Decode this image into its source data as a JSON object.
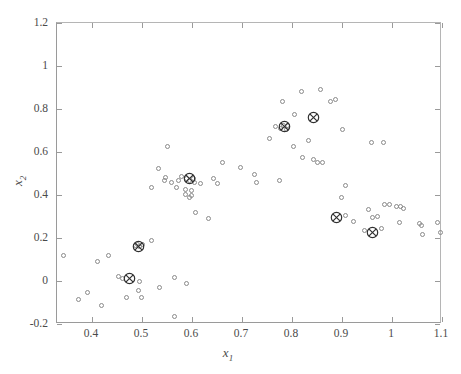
{
  "chart_data": {
    "type": "scatter",
    "title": "",
    "xlabel": "x₁",
    "ylabel": "x₂",
    "xlim": [
      0.33,
      1.1
    ],
    "ylim": [
      -0.2,
      1.2
    ],
    "xticks": [
      0.4,
      0.5,
      0.6,
      0.7,
      0.8,
      0.9,
      1.0,
      1.1
    ],
    "yticks": [
      -0.2,
      0,
      0.2,
      0.4,
      0.6,
      0.8,
      1.0,
      1.2
    ],
    "xticklabels": [
      "0.4",
      "0.5",
      "0.6",
      "0.7",
      "0.8",
      "0.9",
      "1",
      "1.1"
    ],
    "yticklabels": [
      "-0.2",
      "0",
      "0.2",
      "0.4",
      "0.6",
      "0.8",
      "1",
      "1.2"
    ],
    "grid": false,
    "legend": null,
    "marker_color": "#8a8a8a",
    "center_color": "#303030",
    "series": [
      {
        "name": "data-points",
        "marker": "open-circle",
        "points": [
          [
            0.345,
            0.112
          ],
          [
            0.374,
            -0.09
          ],
          [
            0.392,
            -0.057
          ],
          [
            0.42,
            -0.118
          ],
          [
            0.412,
            0.084
          ],
          [
            0.434,
            0.112
          ],
          [
            0.455,
            0.014
          ],
          [
            0.462,
            0.005
          ],
          [
            0.47,
            -0.08
          ],
          [
            0.489,
            0.16
          ],
          [
            0.493,
            0.166
          ],
          [
            0.497,
            0.158
          ],
          [
            0.503,
            0.163
          ],
          [
            0.5,
            -0.082
          ],
          [
            0.494,
            -0.047
          ],
          [
            0.497,
            -0.005
          ],
          [
            0.52,
            0.182
          ],
          [
            0.536,
            -0.034
          ],
          [
            0.566,
            -0.17
          ],
          [
            0.566,
            0.01
          ],
          [
            0.59,
            -0.018
          ],
          [
            0.588,
            0.4
          ],
          [
            0.6,
            0.392
          ],
          [
            0.575,
            0.465
          ],
          [
            0.58,
            0.48
          ],
          [
            0.591,
            0.47
          ],
          [
            0.596,
            0.462
          ],
          [
            0.604,
            0.472
          ],
          [
            0.607,
            0.455
          ],
          [
            0.56,
            0.455
          ],
          [
            0.546,
            0.462
          ],
          [
            0.549,
            0.475
          ],
          [
            0.52,
            0.43
          ],
          [
            0.534,
            0.52
          ],
          [
            0.552,
            0.62
          ],
          [
            0.571,
            0.428
          ],
          [
            0.588,
            0.42
          ],
          [
            0.601,
            0.414
          ],
          [
            0.618,
            0.448
          ],
          [
            0.644,
            0.472
          ],
          [
            0.652,
            0.45
          ],
          [
            0.662,
            0.548
          ],
          [
            0.634,
            0.288
          ],
          [
            0.596,
            0.385
          ],
          [
            0.608,
            0.312
          ],
          [
            0.699,
            0.525
          ],
          [
            0.727,
            0.49
          ],
          [
            0.731,
            0.455
          ],
          [
            0.776,
            0.462
          ],
          [
            0.757,
            0.66
          ],
          [
            0.768,
            0.712
          ],
          [
            0.779,
            0.705
          ],
          [
            0.785,
            0.718
          ],
          [
            0.79,
            0.7
          ],
          [
            0.792,
            0.72
          ],
          [
            0.782,
            0.832
          ],
          [
            0.807,
            0.77
          ],
          [
            0.82,
            0.875
          ],
          [
            0.859,
            0.888
          ],
          [
            0.878,
            0.83
          ],
          [
            0.804,
            0.622
          ],
          [
            0.822,
            0.572
          ],
          [
            0.845,
            0.56
          ],
          [
            0.852,
            0.545
          ],
          [
            0.862,
            0.545
          ],
          [
            0.835,
            0.648
          ],
          [
            0.889,
            0.84
          ],
          [
            0.902,
            0.7
          ],
          [
            0.908,
            0.438
          ],
          [
            0.901,
            0.382
          ],
          [
            0.909,
            0.302
          ],
          [
            0.925,
            0.272
          ],
          [
            0.955,
            0.33
          ],
          [
            0.946,
            0.232
          ],
          [
            0.963,
            0.292
          ],
          [
            0.972,
            0.297
          ],
          [
            0.986,
            0.352
          ],
          [
            0.981,
            0.24
          ],
          [
            0.996,
            0.352
          ],
          [
            1.01,
            0.34
          ],
          [
            1.019,
            0.342
          ],
          [
            1.024,
            0.334
          ],
          [
            1.016,
            0.266
          ],
          [
            1.057,
            0.262
          ],
          [
            1.061,
            0.252
          ],
          [
            1.063,
            0.212
          ],
          [
            1.092,
            0.268
          ],
          [
            1.099,
            0.222
          ],
          [
            0.96,
            0.64
          ],
          [
            0.984,
            0.64
          ]
        ]
      },
      {
        "name": "cluster-centers",
        "marker": "circled-x",
        "points": [
          [
            0.476,
            0.007
          ],
          [
            0.494,
            0.158
          ],
          [
            0.597,
            0.47
          ],
          [
            0.787,
            0.712
          ],
          [
            0.845,
            0.758
          ],
          [
            0.891,
            0.292
          ],
          [
            0.963,
            0.222
          ]
        ]
      }
    ]
  }
}
